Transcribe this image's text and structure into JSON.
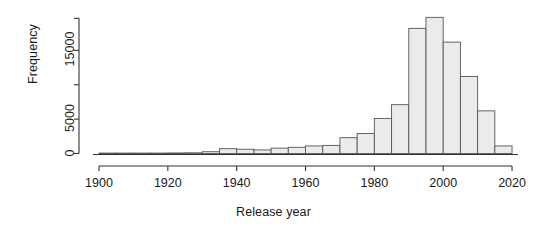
{
  "chart_data": {
    "type": "bar",
    "title": "",
    "subtitle": "",
    "xlabel": "Release year",
    "ylabel": "Frequency",
    "xlim": [
      1900,
      2020
    ],
    "ylim": [
      0,
      19800
    ],
    "bin_width": 5,
    "grid": false,
    "legend": null,
    "xticks": [
      1900,
      1920,
      1940,
      1960,
      1980,
      2000,
      2020
    ],
    "xtick_labels": [
      "1900",
      "1920",
      "1940",
      "1960",
      "1980",
      "2000",
      "2020"
    ],
    "yticks": [
      0,
      5000,
      10000,
      15000
    ],
    "ytick_labels": [
      "0",
      "5000",
      "10000",
      "15000"
    ],
    "ytick_labels_shown": [
      "0",
      "5000",
      "15000"
    ],
    "bin_starts": [
      1900,
      1905,
      1910,
      1915,
      1920,
      1925,
      1930,
      1935,
      1940,
      1945,
      1950,
      1955,
      1960,
      1965,
      1970,
      1975,
      1980,
      1985,
      1990,
      1995,
      2000,
      2005,
      2010,
      2015
    ],
    "categories": [
      "1900-1905",
      "1905-1910",
      "1910-1915",
      "1915-1920",
      "1920-1925",
      "1925-1930",
      "1930-1935",
      "1935-1940",
      "1940-1945",
      "1945-1950",
      "1950-1955",
      "1955-1960",
      "1960-1965",
      "1965-1970",
      "1970-1975",
      "1975-1980",
      "1980-1985",
      "1985-1990",
      "1990-1995",
      "1995-2000",
      "2000-2005",
      "2005-2010",
      "2010-2015",
      "2015-2020"
    ],
    "values": [
      60,
      60,
      60,
      60,
      80,
      100,
      260,
      700,
      620,
      520,
      780,
      900,
      1100,
      1180,
      2300,
      2900,
      5100,
      7100,
      18200,
      19800,
      16200,
      11200,
      6200,
      1100
    ],
    "bar_fill_color": "#ebebeb",
    "bar_border_color": "#555555",
    "axis_color": "#333333",
    "text_color": "#1a1a1a",
    "background_color": "#ffffff"
  },
  "geometry": {
    "plot_left": 99,
    "plot_right": 512,
    "baseline_y": 153.5,
    "y_axis_x": 79,
    "y_axis_top": 17,
    "px_per_year": 3.442,
    "px_per_unit": 0.006876
  }
}
